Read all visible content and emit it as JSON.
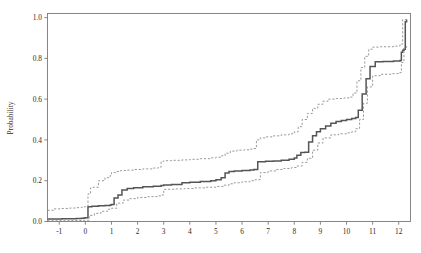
{
  "chart_data": {
    "type": "line",
    "title": "",
    "xlabel": "",
    "ylabel": "Probability",
    "xlim": [
      -1.45,
      12.45
    ],
    "ylim": [
      0.0,
      1.02
    ],
    "grid": false,
    "legend": null,
    "xticks": [
      "-1",
      "0",
      "1",
      "2",
      "3",
      "4",
      "5",
      "6",
      "7",
      "8",
      "9",
      "10",
      "11",
      "12"
    ],
    "xtick_values": [
      -1,
      0,
      1,
      2,
      3,
      4,
      5,
      6,
      7,
      8,
      9,
      10,
      11,
      12
    ],
    "yticks": [
      "0.0",
      "0.2",
      "0.4",
      "0.6",
      "0.8",
      "1.0"
    ],
    "ytick_values": [
      0.0,
      0.2,
      0.4,
      0.6,
      0.8,
      1.0
    ],
    "series": [
      {
        "name": "estimate",
        "style": "solid",
        "color": "#555555",
        "step": "post",
        "x": [
          -1.45,
          -1.2,
          -0.9,
          -0.6,
          -0.35,
          -0.15,
          -0.05,
          0.0,
          0.1,
          0.25,
          0.5,
          0.75,
          0.95,
          1.0,
          1.1,
          1.25,
          1.4,
          1.6,
          1.85,
          2.2,
          2.6,
          2.9,
          3.0,
          3.3,
          3.7,
          4.0,
          4.4,
          4.8,
          5.0,
          5.2,
          5.35,
          5.5,
          5.7,
          6.0,
          6.3,
          6.45,
          6.6,
          6.9,
          7.2,
          7.5,
          7.8,
          8.0,
          8.1,
          8.25,
          8.4,
          8.55,
          8.7,
          8.85,
          9.0,
          9.2,
          9.4,
          9.6,
          9.8,
          10.0,
          10.2,
          10.35,
          10.45,
          10.6,
          10.75,
          10.9,
          11.1,
          11.4,
          11.8,
          12.05,
          12.1,
          12.15,
          12.2,
          12.25,
          12.3
        ],
        "y": [
          0.012,
          0.012,
          0.013,
          0.014,
          0.015,
          0.016,
          0.017,
          0.018,
          0.072,
          0.075,
          0.077,
          0.079,
          0.081,
          0.083,
          0.115,
          0.13,
          0.155,
          0.162,
          0.166,
          0.17,
          0.173,
          0.176,
          0.179,
          0.182,
          0.19,
          0.192,
          0.196,
          0.2,
          0.205,
          0.215,
          0.238,
          0.245,
          0.248,
          0.25,
          0.252,
          0.255,
          0.293,
          0.295,
          0.297,
          0.3,
          0.305,
          0.312,
          0.325,
          0.338,
          0.34,
          0.39,
          0.42,
          0.44,
          0.455,
          0.468,
          0.482,
          0.49,
          0.495,
          0.5,
          0.505,
          0.51,
          0.545,
          0.625,
          0.7,
          0.76,
          0.783,
          0.785,
          0.787,
          0.79,
          0.83,
          0.84,
          0.845,
          0.98,
          0.99
        ]
      },
      {
        "name": "upper-confidence-band",
        "style": "dashed",
        "color": "#9a9a9a",
        "step": "post",
        "x": [
          -1.45,
          -1.2,
          -0.9,
          -0.6,
          -0.35,
          -0.15,
          -0.05,
          0.0,
          0.1,
          0.2,
          0.3,
          0.5,
          0.75,
          0.95,
          1.0,
          1.15,
          1.35,
          1.6,
          1.85,
          2.2,
          2.6,
          2.8,
          2.9,
          3.0,
          3.3,
          3.7,
          4.0,
          4.4,
          4.8,
          5.0,
          5.2,
          5.35,
          5.55,
          5.8,
          6.1,
          6.3,
          6.45,
          6.55,
          6.7,
          6.9,
          7.2,
          7.5,
          7.8,
          8.0,
          8.15,
          8.3,
          8.5,
          8.7,
          8.9,
          9.1,
          9.3,
          9.6,
          9.9,
          10.1,
          10.25,
          10.4,
          10.55,
          10.7,
          10.85,
          11.0,
          11.3,
          11.8,
          12.05,
          12.15,
          12.3
        ],
        "y": [
          0.055,
          0.062,
          0.064,
          0.066,
          0.068,
          0.07,
          0.072,
          0.074,
          0.135,
          0.165,
          0.168,
          0.2,
          0.215,
          0.225,
          0.24,
          0.245,
          0.25,
          0.252,
          0.255,
          0.258,
          0.262,
          0.265,
          0.295,
          0.298,
          0.3,
          0.302,
          0.305,
          0.308,
          0.312,
          0.315,
          0.322,
          0.335,
          0.345,
          0.35,
          0.352,
          0.355,
          0.358,
          0.4,
          0.41,
          0.415,
          0.42,
          0.425,
          0.43,
          0.44,
          0.465,
          0.5,
          0.53,
          0.555,
          0.575,
          0.59,
          0.6,
          0.603,
          0.606,
          0.61,
          0.63,
          0.69,
          0.755,
          0.81,
          0.845,
          0.855,
          0.857,
          0.86,
          0.87,
          0.99,
          1.0
        ]
      },
      {
        "name": "lower-confidence-band",
        "style": "dashed",
        "color": "#9a9a9a",
        "step": "post",
        "x": [
          -1.45,
          -1.0,
          -0.6,
          -0.3,
          -0.1,
          0.0,
          0.15,
          0.35,
          0.6,
          0.85,
          1.0,
          1.2,
          1.45,
          1.7,
          2.0,
          2.4,
          2.75,
          2.9,
          3.0,
          3.4,
          3.8,
          4.2,
          4.6,
          5.0,
          5.3,
          5.5,
          5.7,
          6.0,
          6.3,
          6.5,
          6.7,
          7.0,
          7.3,
          7.6,
          7.9,
          8.1,
          8.3,
          8.5,
          8.7,
          8.9,
          9.1,
          9.4,
          9.7,
          10.0,
          10.2,
          10.35,
          10.5,
          10.65,
          10.8,
          11.0,
          11.3,
          11.7,
          12.0,
          12.1,
          12.2,
          12.3
        ],
        "y": [
          0.004,
          0.004,
          0.005,
          0.005,
          0.006,
          0.006,
          0.03,
          0.04,
          0.05,
          0.06,
          0.065,
          0.09,
          0.105,
          0.112,
          0.118,
          0.122,
          0.126,
          0.13,
          0.158,
          0.16,
          0.162,
          0.165,
          0.168,
          0.172,
          0.178,
          0.185,
          0.19,
          0.195,
          0.2,
          0.205,
          0.24,
          0.248,
          0.255,
          0.26,
          0.265,
          0.272,
          0.29,
          0.31,
          0.35,
          0.385,
          0.41,
          0.425,
          0.43,
          0.435,
          0.44,
          0.455,
          0.5,
          0.58,
          0.66,
          0.715,
          0.722,
          0.725,
          0.73,
          0.78,
          0.85,
          0.86
        ]
      }
    ]
  }
}
